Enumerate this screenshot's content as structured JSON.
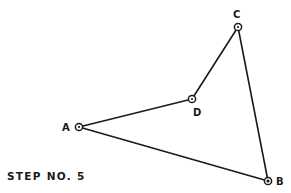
{
  "diagram": {
    "caption": "STEP NO. 5",
    "colors": {
      "ink": "#1a1a1a",
      "background": "#ffffff"
    },
    "points": {
      "A": {
        "label": "A",
        "x": 79,
        "y": 127
      },
      "B": {
        "label": "B",
        "x": 268,
        "y": 181
      },
      "C": {
        "label": "C",
        "x": 238,
        "y": 27
      },
      "D": {
        "label": "D",
        "x": 192,
        "y": 99
      }
    },
    "edges": [
      {
        "from": "A",
        "to": "D"
      },
      {
        "from": "D",
        "to": "C"
      },
      {
        "from": "C",
        "to": "B"
      },
      {
        "from": "B",
        "to": "A"
      }
    ]
  }
}
